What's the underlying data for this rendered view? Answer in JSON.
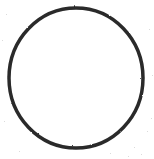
{
  "canvas": {
    "width": 154,
    "height": 159,
    "background_color": "#ffffff",
    "description": "scanned line drawing of a single empty circle"
  },
  "figure": {
    "name": "circle-outline",
    "caption": "",
    "label": "",
    "inner_text": ""
  },
  "style": {
    "stroke_color": "#2b2b2b",
    "stroke_width": 3.5,
    "fill_color": "none",
    "noise_color": "#b9b9b9"
  },
  "shape": {
    "type": "ellipse",
    "center_x": 76,
    "center_y": 78,
    "radius_x": 67,
    "radius_y": 70,
    "left_edge_x": 9,
    "right_edge_x": 143,
    "top_edge_y": 8,
    "bottom_edge_y": 148
  },
  "chart_data": {
    "type": "scatter",
    "title": "",
    "xlabel": "",
    "ylabel": "",
    "categories": [],
    "values": [],
    "annotations": [],
    "legend": [],
    "grid": false,
    "shapes": [
      {
        "kind": "circle",
        "cx": 76,
        "cy": 78,
        "rx": 67,
        "ry": 70,
        "stroke": "#2b2b2b",
        "stroke_width": 3.5,
        "fill": "none"
      }
    ]
  }
}
